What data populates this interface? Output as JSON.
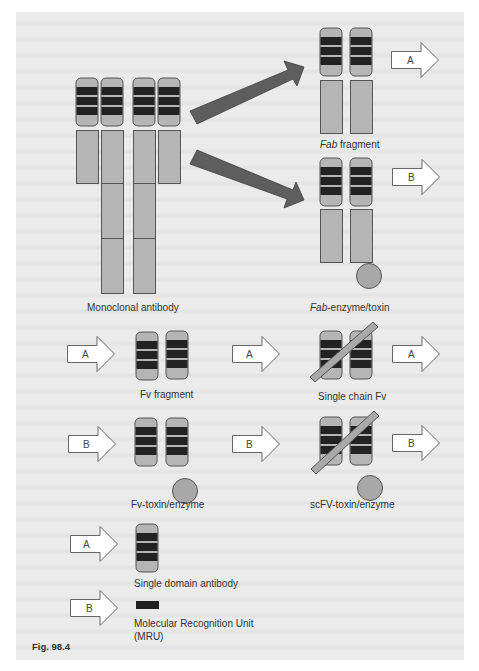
{
  "figure": {
    "caption": "Fig. 98.4",
    "colors": {
      "page_background": "#ebebeb",
      "domain_fill": "#b5b5b5",
      "domain_stroke": "#555555",
      "cdr_band": "#222222",
      "big_arrow": "#5e5e5e",
      "linker_bar": "#a9a9a9",
      "enzyme_circle": "#a8a8a8",
      "outline_arrow_fill": "#ffffff"
    }
  },
  "structures": {
    "monoclonal": {
      "label": "Monoclonal antibody"
    },
    "fab": {
      "label_italic": "Fab",
      "label_rest": " fragment",
      "arrow_label": "A"
    },
    "fab_enzyme": {
      "label_italic": "Fab",
      "label_rest": "-enzyme/toxin",
      "arrow_label": "B"
    },
    "fv": {
      "label": "Fv fragment",
      "arrow_label": "A"
    },
    "fv_toxin": {
      "label": "Fv-toxin/enzyme",
      "arrow_label": "B"
    },
    "scfv": {
      "label": "Single chain Fv",
      "arrow_in_label": "A",
      "arrow_out_label": "A"
    },
    "scfv_toxin": {
      "label": "scFV-toxin/enzyme",
      "arrow_in_label": "B",
      "arrow_out_label": "B"
    },
    "single_domain": {
      "label": "Single domain antibody",
      "arrow_label": "A"
    },
    "mru": {
      "label_line1": "Molecular Recognition Unit",
      "label_line2": "(MRU)",
      "arrow_label": "B"
    }
  }
}
